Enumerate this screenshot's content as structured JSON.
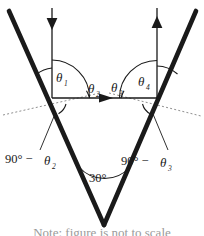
{
  "figure": {
    "background_color": "#ffffff",
    "stroke_color": "#1a1a1a",
    "thick_ray_color": "#1a1a1a",
    "dotted_color": "#8c8c8c",
    "labels": {
      "theta1": "θ",
      "theta1_sub": "1",
      "theta2": "θ",
      "theta2_sub": "2",
      "theta3": "θ",
      "theta3_sub": "3",
      "theta4": "θ",
      "theta4_sub": "4",
      "left_complement": "90° −",
      "left_complement_symbol": "θ",
      "left_complement_sub": "2",
      "right_complement": "90° −",
      "right_complement_symbol": "θ",
      "right_complement_sub": "3",
      "apex_angle": "30°"
    },
    "caption_partial": "Note: figure is not to scale"
  }
}
